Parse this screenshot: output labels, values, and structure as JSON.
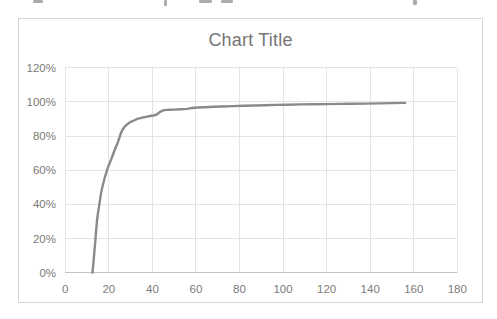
{
  "chart": {
    "title": "Chart Title",
    "colors": {
      "line": "#8a8a8a",
      "gridline": "#e4e4e4",
      "axis_line": "#c3c3c3",
      "tick_text": "#7b7b7b",
      "title_text": "#767676",
      "frame_border": "#d5d5d5",
      "background": "#ffffff"
    }
  },
  "chart_data": {
    "type": "line",
    "title": "Chart Title",
    "xlabel": "",
    "ylabel": "",
    "xlim": [
      0,
      180
    ],
    "ylim_percent": [
      0,
      120
    ],
    "x_ticks": [
      0,
      20,
      40,
      60,
      80,
      100,
      120,
      140,
      160,
      180
    ],
    "y_ticks_percent": [
      0,
      20,
      40,
      60,
      80,
      100,
      120
    ],
    "y_tick_labels": [
      "0%",
      "20%",
      "40%",
      "60%",
      "80%",
      "100%",
      "120%"
    ],
    "grid": true,
    "legend": false,
    "series": [
      {
        "name": "series-1",
        "points": [
          [
            12.5,
            0
          ],
          [
            13,
            7
          ],
          [
            13.4,
            13
          ],
          [
            13.8,
            19
          ],
          [
            14.2,
            25
          ],
          [
            14.6,
            31
          ],
          [
            15,
            35
          ],
          [
            15.5,
            39
          ],
          [
            16,
            43
          ],
          [
            16.5,
            47
          ],
          [
            17,
            50
          ],
          [
            17.6,
            53
          ],
          [
            18.2,
            56
          ],
          [
            18.8,
            58.5
          ],
          [
            19.4,
            61
          ],
          [
            20,
            63
          ],
          [
            21,
            66
          ],
          [
            22,
            69.5
          ],
          [
            23,
            73
          ],
          [
            24,
            76
          ],
          [
            25,
            79.5
          ],
          [
            25.6,
            82
          ],
          [
            26.4,
            84
          ],
          [
            27.4,
            85.7
          ],
          [
            28.4,
            86.8
          ],
          [
            29.4,
            87.8
          ],
          [
            30.6,
            88.6
          ],
          [
            32,
            89.4
          ],
          [
            33,
            90
          ],
          [
            35,
            90.7
          ],
          [
            37,
            91.2
          ],
          [
            39,
            91.7
          ],
          [
            40.5,
            92
          ],
          [
            42,
            92.6
          ],
          [
            43,
            93.6
          ],
          [
            44,
            94.5
          ],
          [
            45,
            95
          ],
          [
            46.5,
            95.3
          ],
          [
            48,
            95.4
          ],
          [
            50,
            95.5
          ],
          [
            53,
            95.7
          ],
          [
            56,
            95.9
          ],
          [
            57.5,
            96.3
          ],
          [
            59,
            96.5
          ],
          [
            61,
            96.7
          ],
          [
            64,
            96.9
          ],
          [
            68,
            97.1
          ],
          [
            72,
            97.3
          ],
          [
            77,
            97.5
          ],
          [
            82,
            97.7
          ],
          [
            87,
            97.9
          ],
          [
            92,
            98
          ],
          [
            97,
            98.2
          ],
          [
            102,
            98.3
          ],
          [
            108,
            98.5
          ],
          [
            114,
            98.6
          ],
          [
            120,
            98.7
          ],
          [
            126,
            98.8
          ],
          [
            132,
            98.9
          ],
          [
            138,
            99
          ],
          [
            144,
            99.1
          ],
          [
            150,
            99.3
          ],
          [
            156,
            99.4
          ]
        ]
      }
    ]
  }
}
